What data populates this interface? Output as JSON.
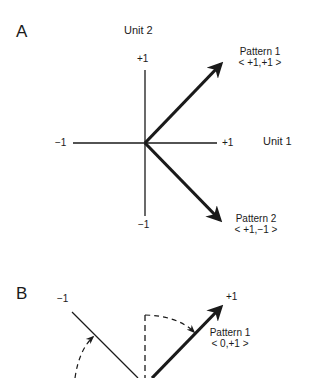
{
  "panel_a": {
    "label": "A",
    "y_axis_title": "Unit 2",
    "x_axis_title": "Unit 1",
    "ticks": {
      "y_top": "+1",
      "y_bottom": "−1",
      "x_left": "−1",
      "x_right": "+1"
    },
    "vectors": [
      {
        "name": "Pattern 1",
        "coords": "< +1,+1 >",
        "x": 1,
        "y": 1
      },
      {
        "name": "Pattern 2",
        "coords": "< +1,−1 >",
        "x": 1,
        "y": -1
      }
    ]
  },
  "panel_b": {
    "label": "B",
    "ticks": {
      "left": "−1",
      "right": "+1"
    },
    "vectors": [
      {
        "name": "Pattern 1",
        "coords": "< 0,+1 >",
        "x": 0,
        "y": 1
      }
    ]
  },
  "colors": {
    "ink": "#1a1a1a",
    "background": "#ffffff"
  }
}
